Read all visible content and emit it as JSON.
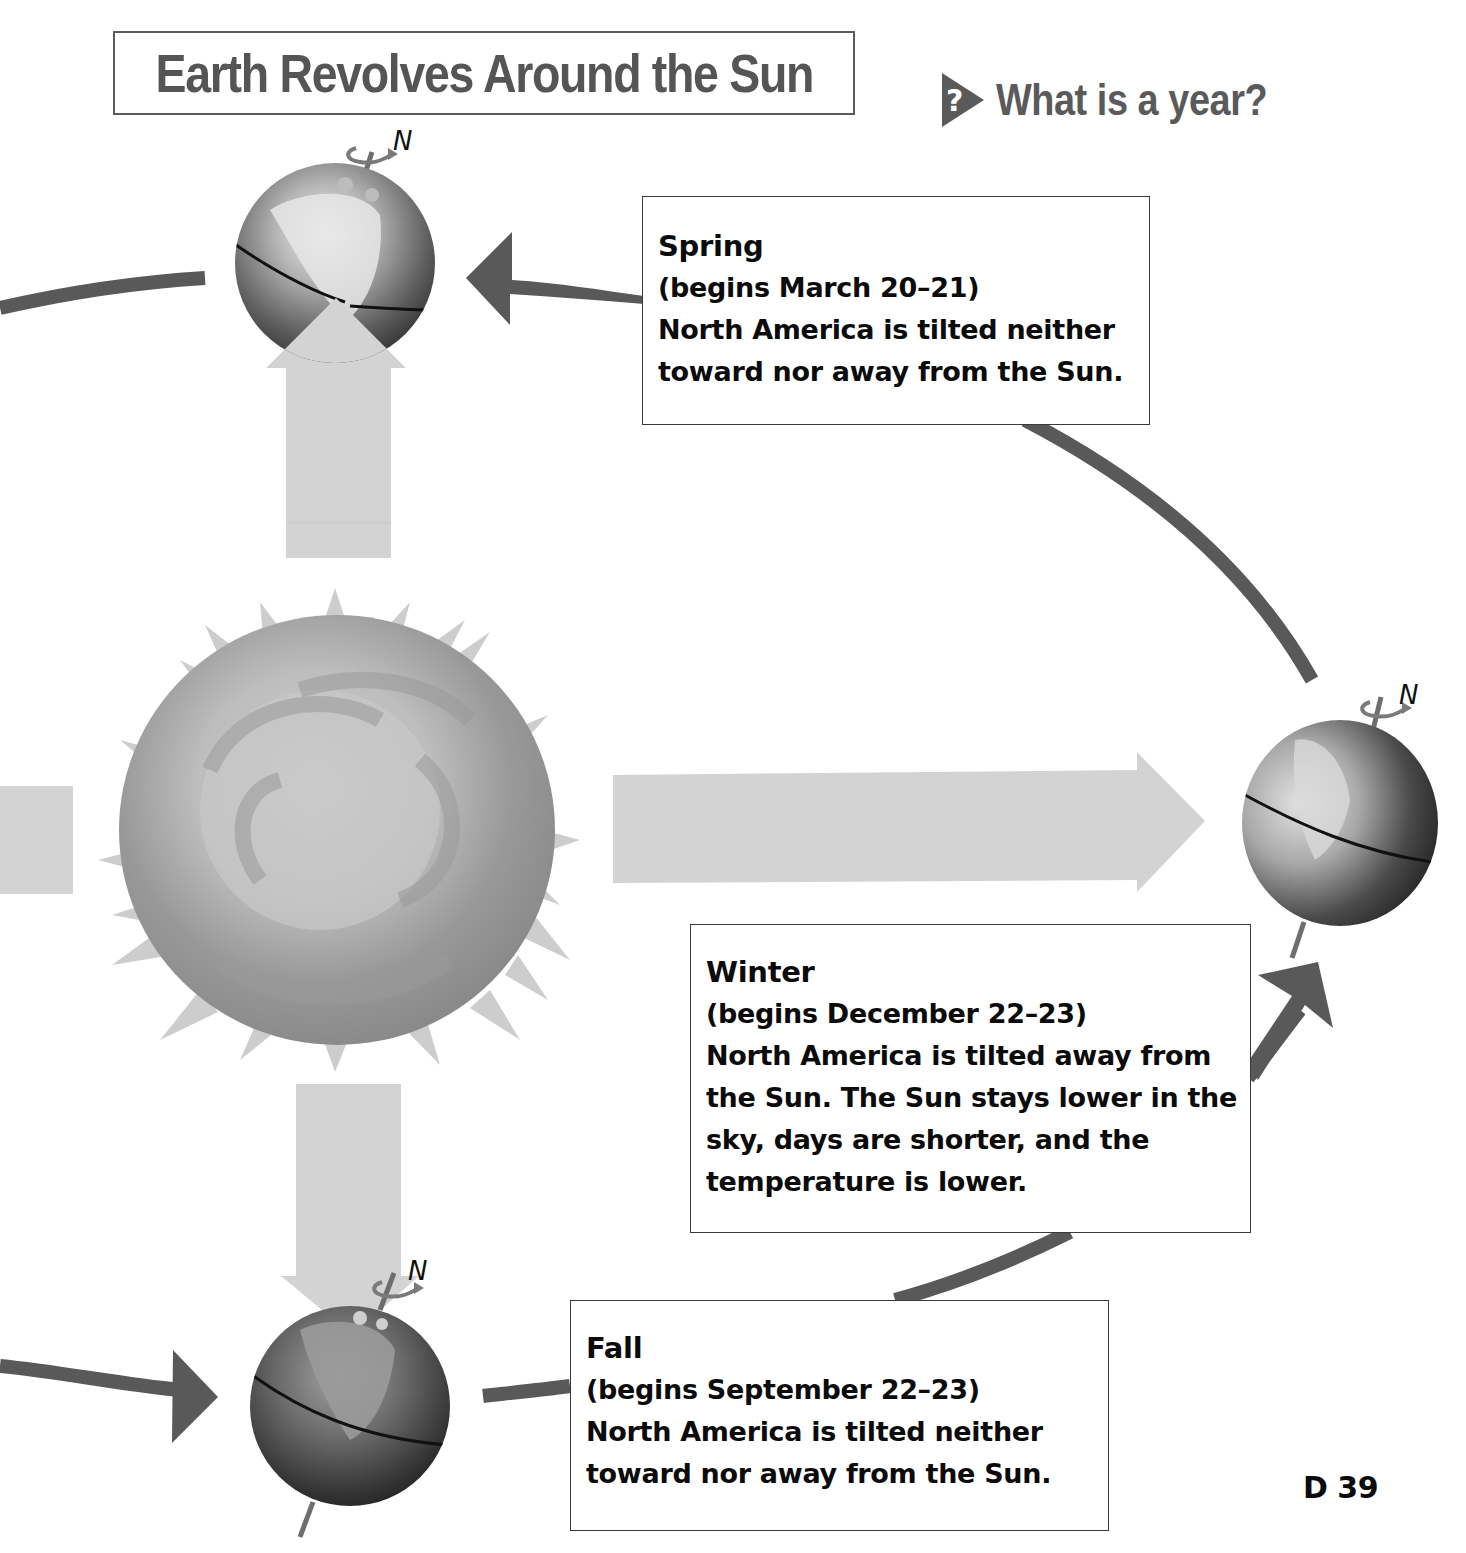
{
  "header": {
    "title": "Earth Revolves Around the Sun",
    "question": "What is a year?",
    "question_icon": "question-arrow-icon"
  },
  "diagram": {
    "center_body": "Sun",
    "orbit_direction": "counterclockwise",
    "axis_label": "N",
    "colors": {
      "orbit_arrow": "#595959",
      "sunlight_arrow": "#d3d3d3",
      "sun_light": "#cfcfcf",
      "sun_dark": "#8e8e8e",
      "box_border": "#3a3a3a",
      "title_text": "#555555"
    },
    "earths": [
      {
        "position": "top",
        "season": "Spring",
        "axis_label": "N"
      },
      {
        "position": "right",
        "season": "Winter",
        "axis_label": "N"
      },
      {
        "position": "bottom",
        "season": "Fall",
        "axis_label": "N"
      }
    ]
  },
  "seasons": {
    "spring": {
      "name": "Spring",
      "dates": "(begins March 20–21)",
      "description": "North America is tilted neither\ntoward nor away from the Sun."
    },
    "winter": {
      "name": "Winter",
      "dates": "(begins December 22–23)",
      "description": "North America is tilted away from\nthe Sun. The Sun stays lower in the\nsky, days are shorter, and the\ntemperature is lower."
    },
    "fall": {
      "name": "Fall",
      "dates": "(begins September 22–23)",
      "description": "North America is tilted neither\ntoward nor away from the Sun."
    }
  },
  "footer": {
    "page_number": "D 39"
  }
}
